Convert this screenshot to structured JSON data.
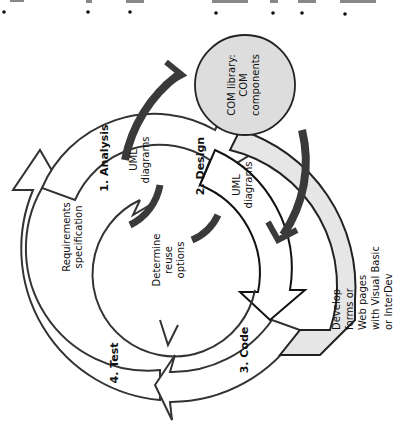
{
  "diagram": {
    "orientation": "rotated 90deg counter-clockwise",
    "colors": {
      "outline": "#333333",
      "fill_light_gray": "#e6e6e6",
      "circle_fill": "#dddddd",
      "dark_arrow": "#3a3a3a",
      "background": "#ffffff"
    },
    "top_strip": {
      "note": "cut-off bulleted text fragments at top edge",
      "bullet_count": 7
    },
    "com_library": {
      "line1": "COM library:",
      "line2": "COM",
      "line3": "components"
    },
    "phases": [
      {
        "label": "1. Analysis",
        "detail_line1": "UML",
        "detail_line2": "diagrams"
      },
      {
        "label": "2. Design",
        "detail_line1": "UML",
        "detail_line2": "diagrams"
      },
      {
        "label": "3. Code"
      },
      {
        "label": "4. Test"
      }
    ],
    "requirements": {
      "line1": "Requirements",
      "line2": "specification"
    },
    "center": {
      "line1": "Determine",
      "line2": "reuse",
      "line3": "options"
    },
    "develop": {
      "line1": "Develop",
      "line2": "forms or",
      "line3": "Web pages",
      "line4": "with Visual Basic",
      "line5": "or InterDev"
    }
  }
}
